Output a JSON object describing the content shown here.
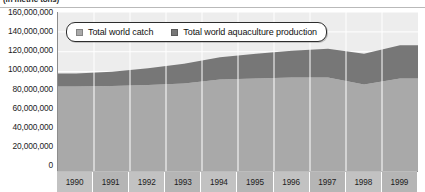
{
  "caption": {
    "units": "(in metric tons)"
  },
  "legend": {
    "items": [
      {
        "label": "Total world catch",
        "color": "#a9a9a9"
      },
      {
        "label": "Total world aquaculture production",
        "color": "#777777"
      }
    ]
  },
  "axes": {
    "y_ticks": [
      "0",
      "20,000,000",
      "40,000,000",
      "60,000,000",
      "80,000,000",
      "100,000,000",
      "120,000,000",
      "140,000,000",
      "160,000,000"
    ],
    "x_ticks": [
      "1990",
      "1991",
      "1992",
      "1993",
      "1994",
      "1995",
      "1996",
      "1997",
      "1998",
      "1999"
    ]
  },
  "colors": {
    "catch": "#a9a9a9",
    "aquaculture": "#777777",
    "plot_background": "#ededed",
    "gridline": "#ffffff",
    "axis_line": "#8d8d8d",
    "x_band": "#c2c2c2"
  },
  "chart_data": {
    "type": "area",
    "stacked": true,
    "title": "",
    "subtitle": "(in metric tons)",
    "xlabel": "",
    "ylabel": "",
    "ylim": [
      0,
      160000000
    ],
    "ytick_interval": 20000000,
    "grid": true,
    "legend_position": "top-center-inside",
    "categories": [
      "1990",
      "1991",
      "1992",
      "1993",
      "1994",
      "1995",
      "1996",
      "1997",
      "1998",
      "1999"
    ],
    "series": [
      {
        "name": "Total world catch",
        "color": "#a9a9a9",
        "values": [
          85000000,
          85500000,
          86500000,
          88000000,
          92000000,
          93000000,
          94000000,
          94000000,
          87000000,
          93000000
        ]
      },
      {
        "name": "Total world aquaculture production",
        "color": "#777777",
        "values": [
          13000000,
          14500000,
          17000000,
          20000000,
          22500000,
          25000000,
          27000000,
          29000000,
          31000000,
          33500000
        ]
      }
    ],
    "totals": [
      98000000,
      100000000,
      103500000,
      108000000,
      114500000,
      118000000,
      121000000,
      123000000,
      118000000,
      126500000
    ]
  }
}
